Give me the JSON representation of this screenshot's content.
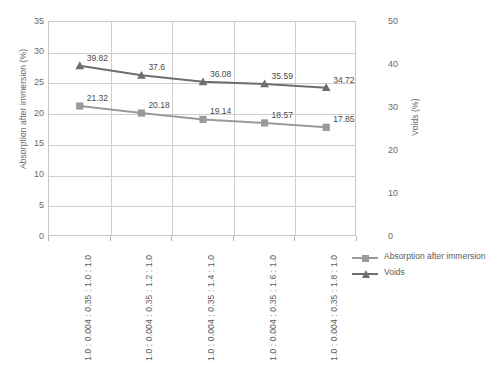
{
  "chart_data": {
    "type": "line",
    "title": "",
    "xlabel": "",
    "categories": [
      "1.0 : 0.004 : 0.35 : 1.0 : 1.0",
      "1.0 : 0.004 : 0.35 : 1.2 : 1.0",
      "1.0 : 0.004 : 0.35 : 1.4 : 1.0",
      "1.0 : 0.004 : 0.35 : 1.6 : 1.0",
      "1.0 : 0.004 : 0.35 : 1.8 : 1.0"
    ],
    "series": [
      {
        "name": "Absorption after immersion",
        "axis": "left",
        "marker": "square",
        "color": "#9a9a9a",
        "values": [
          21.32,
          20.18,
          19.14,
          18.57,
          17.85
        ],
        "labels": [
          "21.32",
          "20.18",
          "19.14",
          "18.57",
          "17.85"
        ]
      },
      {
        "name": "Voids",
        "axis": "right",
        "marker": "triangle",
        "color": "#6e6e6e",
        "values": [
          39.82,
          37.6,
          36.08,
          35.59,
          34.72
        ],
        "labels": [
          "39.82",
          "37.6",
          "36.08",
          "35.59",
          "34.72"
        ]
      }
    ],
    "left_axis": {
      "label": "Absorption after immersion (%)",
      "ylim": [
        0,
        35
      ],
      "ticks": [
        0,
        5,
        10,
        15,
        20,
        25,
        30,
        35
      ],
      "tick_labels": [
        "0",
        "5",
        "10",
        "15",
        "20",
        "25",
        "30",
        "35"
      ]
    },
    "right_axis": {
      "label": "Voids (%)",
      "ylim": [
        0,
        50
      ],
      "ticks": [
        0,
        10,
        20,
        30,
        40,
        50
      ],
      "tick_labels": [
        "0",
        "10",
        "20",
        "30",
        "40",
        "50"
      ]
    },
    "grid": {
      "horizontal": true,
      "vertical": true
    },
    "legend": {
      "position": "right",
      "entries": [
        "Absorption after immersion",
        "Voids"
      ]
    }
  },
  "colors": {
    "absorption": "#9a9a9a",
    "voids": "#6e6e6e",
    "grid": "#cfcfcf",
    "frame": "#c8c8c8",
    "text": "#5b5b5b"
  }
}
